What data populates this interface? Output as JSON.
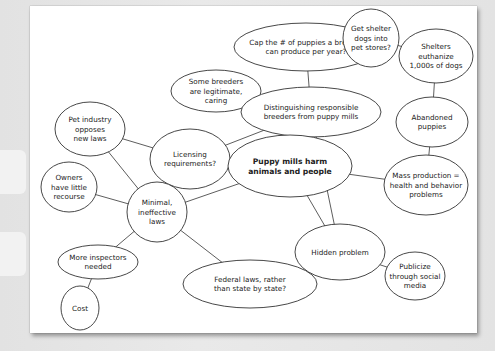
{
  "diagram": {
    "type": "concept-map",
    "central_topic": "Puppy mills harm animals and people",
    "nodes": [
      {
        "id": "cap",
        "lines": [
          "Cap the # of puppies a breeder",
          "can produce per year?"
        ],
        "cx": 306,
        "cy": 47,
        "rx": 72,
        "ry": 24
      },
      {
        "id": "shelter_stores",
        "lines": [
          "Get shelter",
          "dogs into",
          "pet stores?"
        ],
        "cx": 371,
        "cy": 38,
        "rx": 28,
        "ry": 29
      },
      {
        "id": "euthanize",
        "lines": [
          "Shelters",
          "euthanize",
          "1,000s of dogs"
        ],
        "cx": 436,
        "cy": 56,
        "rx": 37,
        "ry": 27
      },
      {
        "id": "some_breeders",
        "lines": [
          "Some breeders",
          "are legitimate,",
          "caring"
        ],
        "cx": 216,
        "cy": 91,
        "rx": 45,
        "ry": 21
      },
      {
        "id": "distinguishing",
        "lines": [
          "Distinguishing responsible",
          "breeders from puppy mills"
        ],
        "cx": 311,
        "cy": 112,
        "rx": 70,
        "ry": 25
      },
      {
        "id": "abandoned",
        "lines": [
          "Abandoned",
          "puppies"
        ],
        "cx": 432,
        "cy": 122,
        "rx": 36,
        "ry": 25
      },
      {
        "id": "pet_industry",
        "lines": [
          "Pet industry",
          "opposes",
          "new laws"
        ],
        "cx": 90,
        "cy": 129,
        "rx": 35,
        "ry": 27
      },
      {
        "id": "licensing",
        "lines": [
          "Licensing",
          "requirements?"
        ],
        "cx": 190,
        "cy": 159,
        "rx": 40,
        "ry": 30
      },
      {
        "id": "puppy_mills",
        "lines": [
          "Puppy mills harm",
          "animals and people"
        ],
        "cx": 290,
        "cy": 166,
        "rx": 62,
        "ry": 31,
        "bold": true
      },
      {
        "id": "mass_production",
        "lines": [
          "Mass production =",
          "health and behavior",
          "problems"
        ],
        "cx": 426,
        "cy": 185,
        "rx": 42,
        "ry": 30
      },
      {
        "id": "owners",
        "lines": [
          "Owners",
          "have little",
          "recourse"
        ],
        "cx": 69,
        "cy": 187,
        "rx": 28,
        "ry": 25
      },
      {
        "id": "minimal_laws",
        "lines": [
          "Minimal,",
          "ineffective",
          "laws"
        ],
        "cx": 157,
        "cy": 212,
        "rx": 30,
        "ry": 30
      },
      {
        "id": "hidden",
        "lines": [
          "Hidden problem"
        ],
        "cx": 340,
        "cy": 252,
        "rx": 45,
        "ry": 28
      },
      {
        "id": "publicize",
        "lines": [
          "Publicize",
          "through social",
          "media"
        ],
        "cx": 415,
        "cy": 276,
        "rx": 30,
        "ry": 24
      },
      {
        "id": "inspectors",
        "lines": [
          "More inspectors",
          "needed"
        ],
        "cx": 98,
        "cy": 262,
        "rx": 40,
        "ry": 17
      },
      {
        "id": "federal",
        "lines": [
          "Federal laws, rather",
          "than state by state?"
        ],
        "cx": 250,
        "cy": 284,
        "rx": 67,
        "ry": 24
      },
      {
        "id": "cost",
        "lines": [
          "Cost"
        ],
        "cx": 80,
        "cy": 308,
        "rx": 19,
        "ry": 22
      }
    ],
    "edges": [
      [
        "cap",
        "distinguishing"
      ],
      [
        "some_breeders",
        "distinguishing"
      ],
      [
        "shelter_stores",
        "euthanize"
      ],
      [
        "euthanize",
        "abandoned"
      ],
      [
        "abandoned",
        "mass_production"
      ],
      [
        "distinguishing",
        "licensing"
      ],
      [
        "distinguishing",
        "puppy_mills"
      ],
      [
        "distinguishing",
        "hidden"
      ],
      [
        "pet_industry",
        "licensing"
      ],
      [
        "pet_industry",
        "minimal_laws"
      ],
      [
        "puppy_mills",
        "mass_production"
      ],
      [
        "puppy_mills",
        "minimal_laws"
      ],
      [
        "puppy_mills",
        "hidden"
      ],
      [
        "owners",
        "minimal_laws"
      ],
      [
        "minimal_laws",
        "inspectors"
      ],
      [
        "minimal_laws",
        "federal"
      ],
      [
        "inspectors",
        "cost"
      ],
      [
        "hidden",
        "publicize"
      ]
    ]
  }
}
